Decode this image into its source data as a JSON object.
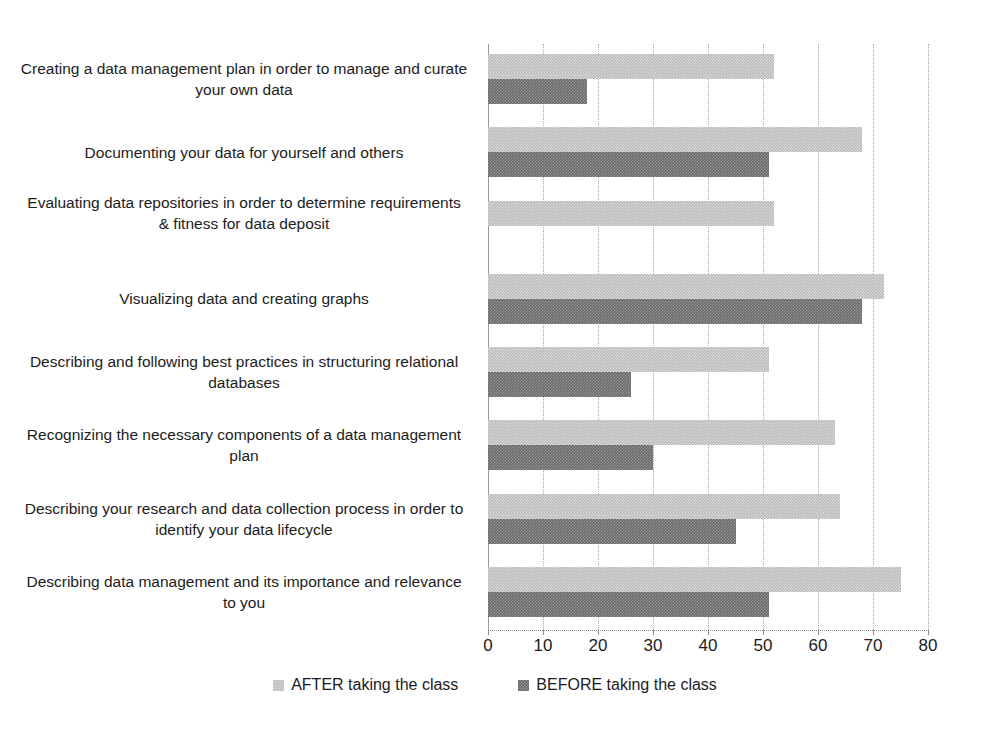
{
  "chart_data": {
    "type": "bar",
    "orientation": "horizontal",
    "title": "",
    "subtitle": "",
    "xlabel": "",
    "ylabel": "",
    "xlim": [
      0,
      80
    ],
    "xticks": [
      0,
      10,
      20,
      30,
      40,
      50,
      60,
      70,
      80
    ],
    "xtick_labels": [
      "0",
      "10",
      "20",
      "30",
      "40",
      "50",
      "60",
      "70",
      "80"
    ],
    "grid": "vertical-dotted",
    "legend_position": "bottom-center",
    "categories": [
      "Creating a data management plan in order to manage and curate your own data",
      "Documenting your data for yourself and others",
      "Evaluating data repositories in order to determine requirements & fitness for data deposit",
      "Visualizing data and creating graphs",
      "Describing and following best practices in structuring relational databases",
      "Recognizing the necessary components of a data management plan",
      "Describing your research and data collection process in order to identify your data lifecycle",
      "Describing data management and its importance and relevance to you"
    ],
    "series": [
      {
        "name": "AFTER taking the class",
        "color": "#b9b9b9",
        "values": [
          52,
          68,
          52,
          72,
          51,
          63,
          64,
          75
        ]
      },
      {
        "name": "BEFORE taking the class",
        "color": "#696969",
        "values": [
          18,
          51,
          0,
          68,
          26,
          30,
          45,
          51
        ]
      }
    ]
  },
  "legend": {
    "items": [
      {
        "label": "AFTER taking the class",
        "swatch": "after"
      },
      {
        "label": "BEFORE taking the class",
        "swatch": "before"
      }
    ]
  },
  "axis": {
    "x_tick_labels": [
      "0",
      "10",
      "20",
      "30",
      "40",
      "50",
      "60",
      "70",
      "80"
    ]
  }
}
